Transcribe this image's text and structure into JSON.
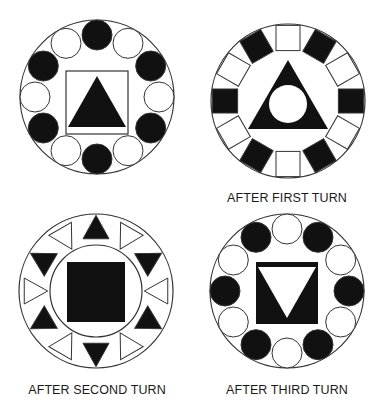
{
  "colors": {
    "ink": "#111111",
    "paper": "#ffffff",
    "stroke": "#333333"
  },
  "figures": [
    {
      "id": "initial",
      "caption": "",
      "ring_shape": "circle",
      "ring_count": 12,
      "ring_pattern": [
        "black",
        "white",
        "black",
        "white",
        "black",
        "white",
        "black",
        "white",
        "black",
        "white",
        "black",
        "white"
      ],
      "ring_start": "top",
      "center_frame": "square-outline",
      "center_shape": "triangle-up",
      "center_shape_fill": "black"
    },
    {
      "id": "after-first-turn",
      "caption": "AFTER FIRST TURN",
      "ring_shape": "square",
      "ring_count": 12,
      "ring_pattern": [
        "white",
        "black",
        "white",
        "black",
        "white",
        "black",
        "white",
        "black",
        "white",
        "black",
        "white",
        "black"
      ],
      "ring_start": "top",
      "center_frame": "none",
      "center_shape": "triangle-up-with-circle-hole",
      "center_shape_fill": "black"
    },
    {
      "id": "after-second-turn",
      "caption": "AFTER SECOND TURN",
      "ring_shape": "triangle",
      "ring_count": 12,
      "ring_pattern": [
        "black",
        "white",
        "black",
        "white",
        "black",
        "white",
        "black",
        "white",
        "black",
        "white",
        "black",
        "white"
      ],
      "ring_start": "top",
      "center_frame": "circle-outline",
      "center_shape": "square",
      "center_shape_fill": "black"
    },
    {
      "id": "after-third-turn",
      "caption": "AFTER THIRD TURN",
      "ring_shape": "circle",
      "ring_count": 12,
      "ring_pattern": [
        "white",
        "black",
        "white",
        "black",
        "white",
        "black",
        "white",
        "black",
        "white",
        "black",
        "white",
        "black"
      ],
      "ring_start": "top",
      "center_frame": "square-filled",
      "center_shape": "triangle-down",
      "center_shape_fill": "white"
    }
  ]
}
